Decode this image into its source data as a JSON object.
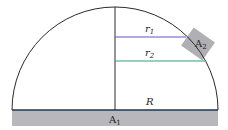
{
  "diagram": {
    "labels": {
      "r1": "r",
      "r1_sub": "1",
      "r2": "r",
      "r2_sub": "2",
      "R": "R",
      "A1": "A",
      "A1_sub": "1",
      "A2": "A",
      "A2_sub": "2"
    },
    "colors": {
      "outline": "#2a2a2a",
      "r1_line": "#6a4fc9",
      "r2_line": "#2aa37a",
      "base_band": "#b8b8bc",
      "base_line": "#1f3550",
      "patch": "#b0b0b4"
    }
  }
}
